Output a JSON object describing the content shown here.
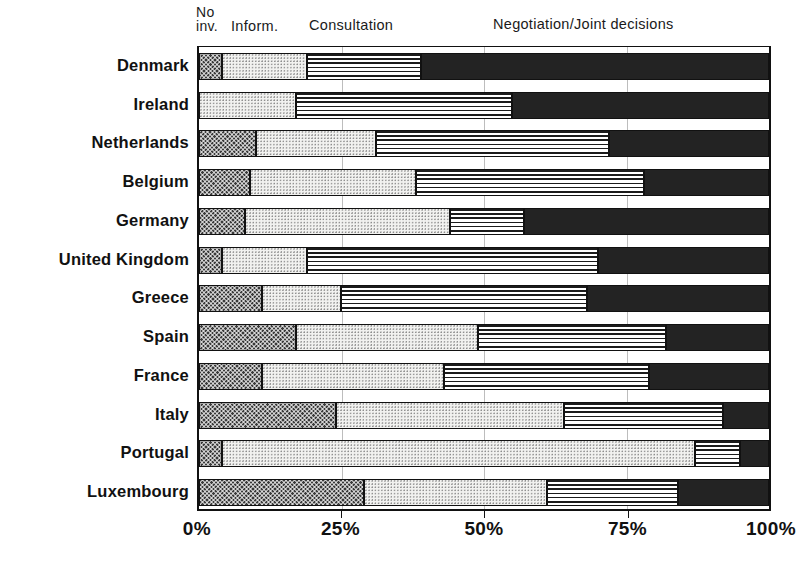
{
  "clipped_title": "",
  "legend": {
    "no_involvement": "No\ninv.",
    "information": "Inform.",
    "consultation": "Consultation",
    "negotiation": "Negotiation/Joint decisions"
  },
  "axis": {
    "ticks": [
      "0%",
      "25%",
      "50%",
      "75%",
      "100%"
    ],
    "tick_values": [
      0,
      25,
      50,
      75,
      100
    ]
  },
  "colors": {
    "no_involvement": "#3a3a3a",
    "information": "#f2f2f0",
    "consultation": "#ffffff",
    "negotiation": "#232323",
    "axis": "#111111",
    "grid": "#bdbdbd"
  },
  "chart_data": {
    "type": "bar",
    "orientation": "horizontal",
    "stacked": true,
    "normalized": true,
    "title": "",
    "xlabel": "",
    "ylabel": "",
    "xlim": [
      0,
      100
    ],
    "grid": true,
    "legend_position": "top",
    "categories": [
      "Denmark",
      "Ireland",
      "Netherlands",
      "Belgium",
      "Germany",
      "United Kingdom",
      "Greece",
      "Spain",
      "France",
      "Italy",
      "Portugal",
      "Luxembourg"
    ],
    "series": [
      {
        "name": "No inv.",
        "values": [
          4,
          0,
          10,
          9,
          8,
          4,
          11,
          17,
          11,
          24,
          4,
          29
        ]
      },
      {
        "name": "Inform.",
        "values": [
          15,
          17,
          21,
          29,
          36,
          15,
          14,
          32,
          32,
          40,
          83,
          32
        ]
      },
      {
        "name": "Consultation",
        "values": [
          20,
          38,
          41,
          40,
          13,
          51,
          43,
          33,
          36,
          28,
          8,
          23
        ]
      },
      {
        "name": "Negotiation/Joint decisions",
        "values": [
          61,
          45,
          28,
          22,
          43,
          30,
          32,
          18,
          21,
          8,
          5,
          16
        ]
      }
    ]
  }
}
